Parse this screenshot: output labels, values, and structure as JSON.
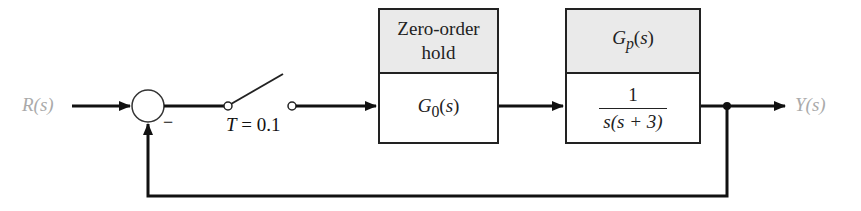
{
  "diagram": {
    "input_label": "R(s)",
    "output_label": "Y(s)",
    "summing_junction": {
      "feedback_sign": "−"
    },
    "sampler": {
      "label": "T = 0.1"
    },
    "blocks": [
      {
        "header": "Zero-order hold",
        "header_line1": "Zero-order",
        "header_line2": "hold",
        "body": "G0(s)",
        "body_main": "G",
        "body_sub": "0",
        "body_arg": "(s)"
      },
      {
        "header": "Gp(s)",
        "header_main": "G",
        "header_sub": "p",
        "header_arg": "(s)",
        "body_numerator": "1",
        "body_denominator": "s(s + 3)"
      }
    ],
    "colors": {
      "line": "#111111",
      "header_fill": "#eaeaea",
      "signal_label": "#aaaaaa"
    }
  }
}
